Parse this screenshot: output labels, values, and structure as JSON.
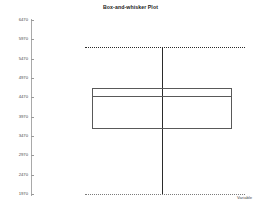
{
  "chart_data": {
    "type": "box",
    "title": "Box-and-whisker Plot",
    "xlabel": "Variable",
    "ylabel": "",
    "grid": false,
    "legend": false,
    "ylim": [
      1970,
      6470
    ],
    "y_ticks": [
      6470,
      5970,
      5470,
      4970,
      4470,
      3970,
      3470,
      2970,
      2470,
      1970
    ],
    "categories": [
      "Variable"
    ],
    "boxes": [
      {
        "label": "Variable",
        "whisker_high": 5760,
        "q3": 4720,
        "median": 4510,
        "q1": 3660,
        "whisker_low": 1970
      }
    ]
  },
  "chart": {
    "title": "Box-and-whisker Plot",
    "x_axis_label": "Variable"
  }
}
